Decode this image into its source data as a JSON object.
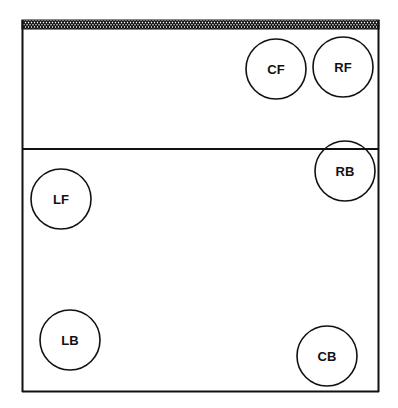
{
  "diagram": {
    "type": "volleyball-court-positions",
    "net": {
      "label": "",
      "pattern": "crosshatch"
    },
    "colors": {
      "line": "#111111",
      "background": "#ffffff"
    },
    "players": [
      {
        "id": "cf",
        "label": "CF",
        "cx": 276,
        "cy": 69
      },
      {
        "id": "rf",
        "label": "RF",
        "cx": 343,
        "cy": 67
      },
      {
        "id": "rb",
        "label": "RB",
        "cx": 345,
        "cy": 171
      },
      {
        "id": "lf",
        "label": "LF",
        "cx": 61,
        "cy": 199
      },
      {
        "id": "lb",
        "label": "LB",
        "cx": 70,
        "cy": 340
      },
      {
        "id": "cb",
        "label": "CB",
        "cx": 327,
        "cy": 356
      }
    ]
  }
}
